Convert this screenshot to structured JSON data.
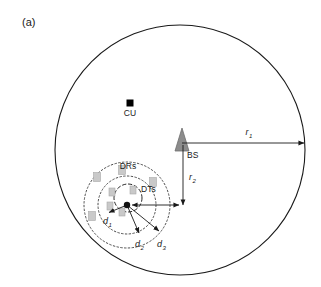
{
  "figure": {
    "panel_label": "(a)",
    "width": 321,
    "height": 287,
    "background": "#ffffff"
  },
  "colors": {
    "outline": "#1a1a1a",
    "dotted": "#3a3a3a",
    "bs_fill": "#8c8c8c",
    "bs_stroke": "#6e6e6e",
    "cu_fill": "#000000",
    "device_fill": "#c9c9c9",
    "device_stroke": "#a8a8a8",
    "arrow": "#1a1a1a",
    "text": "#1a1a1a"
  },
  "cell": {
    "name": "macro-cell-boundary",
    "cx": 180,
    "cy": 150,
    "r": 125
  },
  "nodes": [
    {
      "id": "cu",
      "label": "CU",
      "shape": "filled-square",
      "x": 130,
      "y": 103,
      "size": 7,
      "label_dx": 0,
      "label_dy": 13
    },
    {
      "id": "bs",
      "label": "BS",
      "shape": "triangle",
      "x": 182,
      "y": 140,
      "size": 11,
      "label_dx": 5,
      "label_dy": 16
    }
  ],
  "radii": [
    {
      "id": "r1",
      "label": "r",
      "subscript": "1",
      "type": "double-arrow",
      "x1": 182,
      "y1": 143,
      "x2": 304,
      "y2": 143,
      "label_x": 249,
      "label_y": 134
    },
    {
      "id": "r2",
      "label": "r",
      "subscript": "2",
      "type": "double-arrow",
      "x1": 183,
      "y1": 145,
      "x2": 183,
      "y2": 205,
      "label_x": 189,
      "label_y": 178
    }
  ],
  "cluster": {
    "hub_x": 127,
    "hub_y": 205,
    "rings": [
      {
        "id": "drs-outer-ring",
        "cx": 127,
        "cy": 205,
        "r": 43,
        "style": "dotted",
        "label": "DRs",
        "label_x": 128,
        "label_y": 166
      },
      {
        "id": "drs-inner-ring",
        "cx": 127,
        "cy": 205,
        "r": 29,
        "style": "dotted",
        "label": "",
        "label_x": 0,
        "label_y": 0
      },
      {
        "id": "dts-ring",
        "cx": 128,
        "cy": 198,
        "r": 14,
        "style": "dashed",
        "label": "DTs",
        "label_x": 140,
        "label_y": 189
      }
    ],
    "distances": [
      {
        "id": "d1",
        "label": "d",
        "subscript": "1",
        "x1": 127,
        "y1": 205,
        "x2": 108,
        "y2": 213,
        "label_x": 106,
        "label_y": 222
      },
      {
        "id": "d2",
        "label": "d",
        "subscript": "2",
        "x1": 127,
        "y1": 205,
        "x2": 140,
        "y2": 235,
        "label_x": 139,
        "label_y": 246
      },
      {
        "id": "d3",
        "label": "d",
        "subscript": "3",
        "x1": 127,
        "y1": 205,
        "x2": 160,
        "y2": 233,
        "label_x": 161,
        "label_y": 246
      }
    ],
    "hub_link": {
      "id": "hub-to-r2",
      "x1": 127,
      "y1": 205,
      "x2": 183,
      "y2": 205
    },
    "devices": [
      {
        "x": 97,
        "y": 177,
        "w": 7,
        "h": 9
      },
      {
        "x": 122,
        "y": 170,
        "w": 7,
        "h": 9
      },
      {
        "x": 153,
        "y": 182,
        "w": 7,
        "h": 9
      },
      {
        "x": 92,
        "y": 216,
        "w": 7,
        "h": 9
      },
      {
        "x": 112,
        "y": 192,
        "w": 6,
        "h": 8
      },
      {
        "x": 133,
        "y": 190,
        "w": 6,
        "h": 8
      },
      {
        "x": 122,
        "y": 212,
        "w": 6,
        "h": 8
      },
      {
        "x": 110,
        "y": 206,
        "w": 6,
        "h": 8
      }
    ]
  }
}
